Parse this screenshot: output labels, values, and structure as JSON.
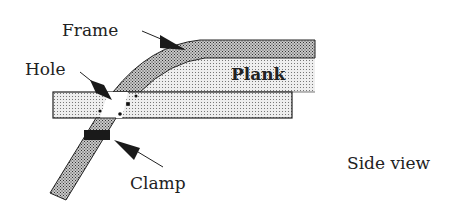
{
  "diagram": {
    "labels": {
      "frame": "Frame",
      "hole": "Hole",
      "plank": "Plank",
      "clamp": "Clamp",
      "view": "Side view"
    },
    "colors": {
      "outline": "#222222",
      "dense_fill": "#8a8a8a",
      "light_fill": "#d4d4d4",
      "arrow": "#1a1a1a",
      "background": "#ffffff"
    }
  }
}
